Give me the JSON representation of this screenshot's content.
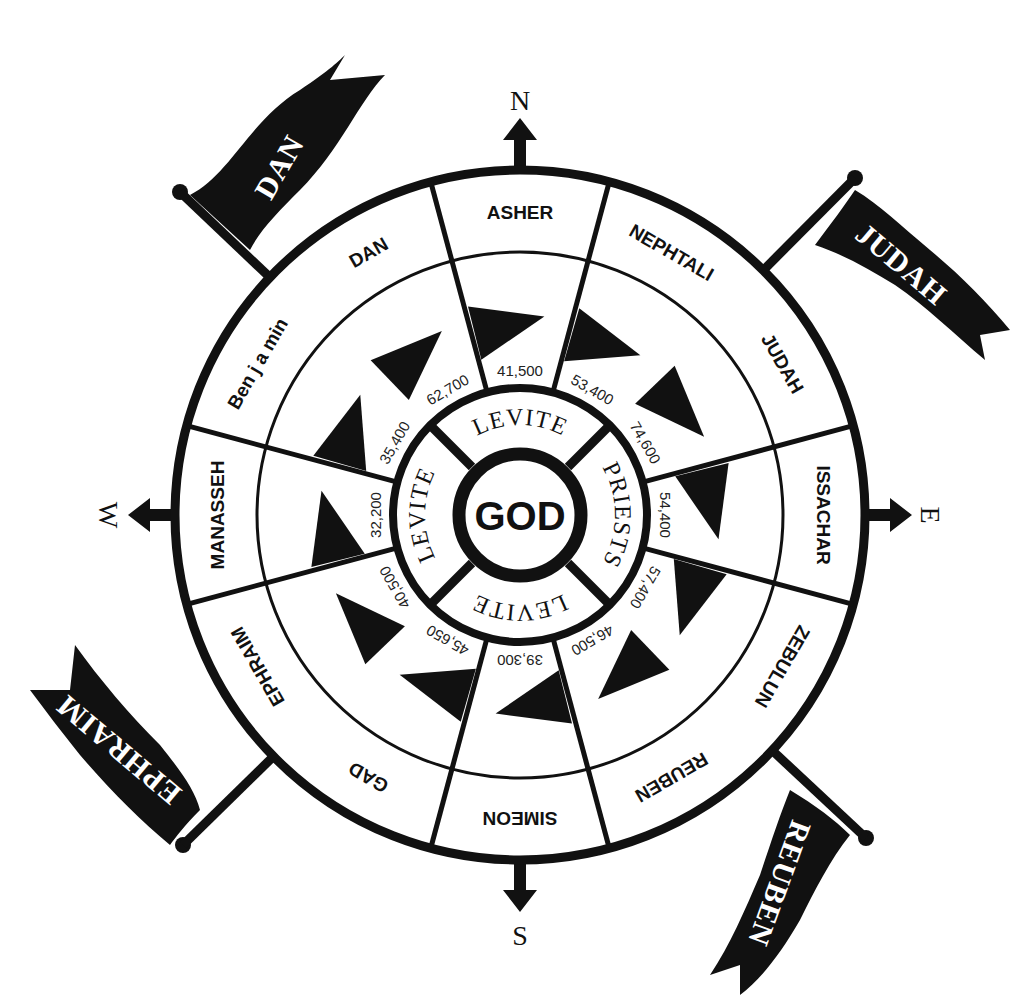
{
  "diagram": {
    "center": {
      "x": 520,
      "y": 515
    },
    "colors": {
      "ink": "#111111",
      "paper": "#ffffff"
    },
    "center_label": "GOD",
    "inner_ring": [
      {
        "label": "LEVITE",
        "position": "north"
      },
      {
        "label": "PRIESTS",
        "position": "east"
      },
      {
        "label": "LEVITE",
        "position": "south"
      },
      {
        "label": "LEVITE",
        "position": "west"
      }
    ],
    "compass": [
      {
        "label": "N",
        "direction": "north"
      },
      {
        "label": "E",
        "direction": "east"
      },
      {
        "label": "S",
        "direction": "south"
      },
      {
        "label": "W",
        "direction": "west"
      }
    ],
    "tribes": [
      {
        "name": "ASHER",
        "count": "41,500",
        "angle": 0
      },
      {
        "name": "NEPHTALI",
        "count": "53,400",
        "angle": 30
      },
      {
        "name": "JUDAH",
        "count": "74,600",
        "angle": 60
      },
      {
        "name": "ISSACHAR",
        "count": "54,400",
        "angle": 90
      },
      {
        "name": "ZEBULUN",
        "count": "57,400",
        "angle": 120
      },
      {
        "name": "REUBEN",
        "count": "46,500",
        "angle": 150
      },
      {
        "name": "SIMEON",
        "count": "39,300",
        "angle": 180
      },
      {
        "name": "GAD",
        "count": "45,650",
        "angle": 210
      },
      {
        "name": "EPHRAIM",
        "count": "40,500",
        "angle": 240
      },
      {
        "name": "MANASSEH",
        "count": "32,200",
        "angle": 270
      },
      {
        "name": "Ben j a min",
        "count": "35,400",
        "angle": 300
      },
      {
        "name": "DAN",
        "count": "62,700",
        "angle": 330
      }
    ],
    "banners": [
      {
        "label": "DAN",
        "corner": "north-west"
      },
      {
        "label": "JUDAH",
        "corner": "north-east"
      },
      {
        "label": "REUBEN",
        "corner": "south-east"
      },
      {
        "label": "EPHRAIM",
        "corner": "south-west"
      }
    ]
  }
}
